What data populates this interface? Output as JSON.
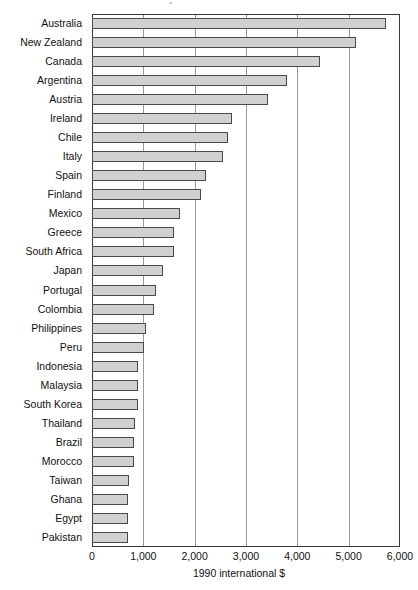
{
  "chart_data": {
    "type": "bar",
    "orientation": "horizontal",
    "title": "",
    "xlabel": "1990 international $",
    "ylabel": "",
    "xlim": [
      0,
      6000
    ],
    "xticks": [
      0,
      1000,
      2000,
      3000,
      4000,
      5000,
      6000
    ],
    "xtick_labels": [
      "0",
      "1,000",
      "2,000",
      "3,000",
      "4,000",
      "5,000",
      "6,000"
    ],
    "grid": "vertical",
    "legend": "none",
    "bar_fill_color": "#d0d0d0",
    "bar_edge_color": "#4a4a4a",
    "axis_color": "#3a3a3a",
    "gridline_color": "#9a9a9a",
    "categories": [
      "Australia",
      "New Zealand",
      "Canada",
      "Argentina",
      "Austria",
      "Ireland",
      "Chile",
      "Italy",
      "Spain",
      "Finland",
      "Mexico",
      "Greece",
      "South Africa",
      "Japan",
      "Portugal",
      "Colombia",
      "Philippines",
      "Peru",
      "Indonesia",
      "Malaysia",
      "South Korea",
      "Thailand",
      "Brazil",
      "Morocco",
      "Taiwan",
      "Ghana",
      "Egypt",
      "Pakistan"
    ],
    "values": [
      5720,
      5150,
      4450,
      3800,
      3420,
      2720,
      2650,
      2550,
      2220,
      2120,
      1720,
      1590,
      1590,
      1390,
      1250,
      1210,
      1060,
      1020,
      900,
      890,
      890,
      840,
      820,
      820,
      730,
      710,
      700,
      700
    ]
  }
}
